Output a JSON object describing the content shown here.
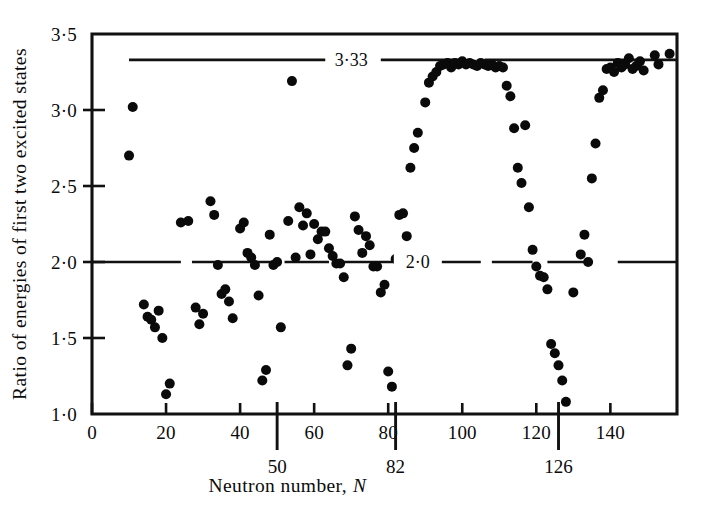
{
  "figure": {
    "background_color": "#ffffff",
    "ink_color": "#0b0b0b"
  },
  "chart_data": {
    "type": "scatter",
    "title": "",
    "xlabel_text": "Neutron number,",
    "xlabel_symbol": "N",
    "ylabel": "Ratio of energies of first two excited states",
    "xlim": [
      0,
      158
    ],
    "ylim": [
      1.0,
      3.5
    ],
    "grid": false,
    "legend": "none",
    "xticks": [
      0,
      20,
      40,
      60,
      80,
      100,
      120,
      140
    ],
    "xtick_labels": [
      "0",
      "20",
      "40",
      "60",
      "80",
      "100",
      "120",
      "140"
    ],
    "yticks": [
      1.0,
      1.5,
      2.0,
      2.5,
      3.0,
      3.5
    ],
    "ytick_labels": [
      "1·0",
      "1·5",
      "2·0",
      "2·5",
      "3·0",
      "3·5"
    ],
    "magic_numbers": [
      {
        "value": 50,
        "label": "50"
      },
      {
        "value": 82,
        "label": "82"
      },
      {
        "value": 126,
        "label": "126"
      }
    ],
    "reference_lines": [
      {
        "y": 3.33,
        "label": "3·33",
        "style": "broken",
        "segments": [
          [
            10,
            63
          ],
          [
            78,
            100
          ],
          [
            106,
            158
          ]
        ],
        "label_x": 70
      },
      {
        "y": 2.0,
        "label": "2·0",
        "style": "dashed",
        "segments": [
          [
            0,
            24
          ],
          [
            27,
            49
          ],
          [
            52,
            64
          ],
          [
            67,
            84
          ],
          [
            92,
            105
          ],
          [
            108,
            119
          ],
          [
            123,
            134
          ],
          [
            142,
            158
          ]
        ],
        "label_x": 88
      }
    ],
    "series": [
      {
        "name": "Nuclei",
        "marker": "filled-circle",
        "marker_color": "#0a0a0a",
        "points": [
          [
            10,
            2.7
          ],
          [
            11,
            3.02
          ],
          [
            14,
            1.72
          ],
          [
            15,
            1.64
          ],
          [
            16,
            1.62
          ],
          [
            17,
            1.57
          ],
          [
            18,
            1.68
          ],
          [
            19,
            1.5
          ],
          [
            20,
            1.13
          ],
          [
            21,
            1.2
          ],
          [
            24,
            2.26
          ],
          [
            26,
            2.27
          ],
          [
            28,
            1.7
          ],
          [
            29,
            1.59
          ],
          [
            30,
            1.66
          ],
          [
            32,
            2.4
          ],
          [
            33,
            2.31
          ],
          [
            34,
            1.98
          ],
          [
            35,
            1.79
          ],
          [
            36,
            1.82
          ],
          [
            37,
            1.74
          ],
          [
            38,
            1.63
          ],
          [
            40,
            2.22
          ],
          [
            41,
            2.26
          ],
          [
            42,
            2.06
          ],
          [
            43,
            2.03
          ],
          [
            44,
            1.98
          ],
          [
            45,
            1.78
          ],
          [
            46,
            1.22
          ],
          [
            47,
            1.29
          ],
          [
            48,
            2.18
          ],
          [
            49,
            1.98
          ],
          [
            50,
            2.0
          ],
          [
            51,
            1.57
          ],
          [
            53,
            2.27
          ],
          [
            54,
            3.19
          ],
          [
            55,
            2.03
          ],
          [
            56,
            2.36
          ],
          [
            57,
            2.24
          ],
          [
            58,
            2.32
          ],
          [
            59,
            2.05
          ],
          [
            60,
            2.25
          ],
          [
            61,
            2.15
          ],
          [
            62,
            2.2
          ],
          [
            63,
            2.2
          ],
          [
            64,
            2.09
          ],
          [
            65,
            2.04
          ],
          [
            66,
            1.99
          ],
          [
            67,
            1.99
          ],
          [
            68,
            1.9
          ],
          [
            69,
            1.32
          ],
          [
            70,
            1.43
          ],
          [
            71,
            2.3
          ],
          [
            72,
            2.21
          ],
          [
            73,
            2.06
          ],
          [
            74,
            2.17
          ],
          [
            75,
            2.11
          ],
          [
            76,
            1.97
          ],
          [
            77,
            1.97
          ],
          [
            78,
            1.8
          ],
          [
            79,
            1.85
          ],
          [
            80,
            1.28
          ],
          [
            81,
            1.18
          ],
          [
            82,
            2.02
          ],
          [
            83,
            2.31
          ],
          [
            84,
            2.32
          ],
          [
            85,
            2.17
          ],
          [
            86,
            2.62
          ],
          [
            87,
            2.75
          ],
          [
            88,
            2.85
          ],
          [
            90,
            3.05
          ],
          [
            91,
            3.18
          ],
          [
            92,
            3.22
          ],
          [
            93,
            3.25
          ],
          [
            94,
            3.29
          ],
          [
            95,
            3.3
          ],
          [
            96,
            3.31
          ],
          [
            97,
            3.28
          ],
          [
            98,
            3.31
          ],
          [
            99,
            3.3
          ],
          [
            100,
            3.32
          ],
          [
            101,
            3.3
          ],
          [
            102,
            3.31
          ],
          [
            103,
            3.3
          ],
          [
            104,
            3.29
          ],
          [
            105,
            3.31
          ],
          [
            106,
            3.3
          ],
          [
            107,
            3.29
          ],
          [
            108,
            3.3
          ],
          [
            109,
            3.28
          ],
          [
            110,
            3.29
          ],
          [
            111,
            3.28
          ],
          [
            112,
            3.16
          ],
          [
            113,
            3.09
          ],
          [
            114,
            2.88
          ],
          [
            115,
            2.62
          ],
          [
            116,
            2.52
          ],
          [
            117,
            2.9
          ],
          [
            118,
            2.36
          ],
          [
            119,
            2.08
          ],
          [
            120,
            1.97
          ],
          [
            121,
            1.91
          ],
          [
            122,
            1.9
          ],
          [
            123,
            1.82
          ],
          [
            124,
            1.46
          ],
          [
            125,
            1.4
          ],
          [
            126,
            1.32
          ],
          [
            127,
            1.22
          ],
          [
            128,
            1.08
          ],
          [
            130,
            1.8
          ],
          [
            132,
            2.05
          ],
          [
            133,
            2.18
          ],
          [
            134,
            2.0
          ],
          [
            135,
            2.55
          ],
          [
            136,
            2.78
          ],
          [
            137,
            3.08
          ],
          [
            138,
            3.13
          ],
          [
            139,
            3.27
          ],
          [
            140,
            3.28
          ],
          [
            141,
            3.25
          ],
          [
            142,
            3.31
          ],
          [
            143,
            3.28
          ],
          [
            144,
            3.3
          ],
          [
            145,
            3.34
          ],
          [
            146,
            3.27
          ],
          [
            147,
            3.29
          ],
          [
            148,
            3.32
          ],
          [
            149,
            3.26
          ],
          [
            152,
            3.36
          ],
          [
            153,
            3.3
          ],
          [
            156,
            3.37
          ]
        ]
      }
    ]
  }
}
